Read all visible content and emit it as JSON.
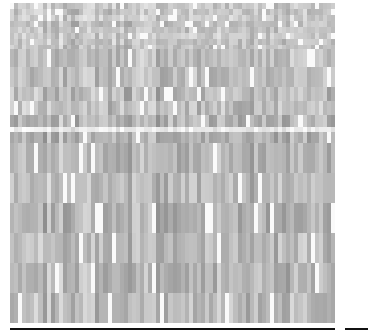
{
  "chart_data": {
    "type": "heatmap",
    "title": "",
    "xlabel": "",
    "ylabel": "",
    "colormap": "grayscale",
    "colors": {
      "low": "#6e6e6e",
      "high": "#ffffff",
      "axis": "#111111"
    },
    "n_columns": 80,
    "row_heights_px": [
      6,
      6,
      6,
      6,
      6,
      6,
      6,
      4,
      18,
      20,
      14,
      14,
      12,
      5,
      11,
      30,
      30,
      30,
      30,
      30,
      30
    ],
    "row_base_gray": [
      200,
      195,
      205,
      190,
      198,
      202,
      196,
      192,
      190,
      188,
      185,
      190,
      180,
      235,
      178,
      182,
      186,
      178,
      184,
      182,
      184
    ],
    "row_variance": [
      40,
      40,
      40,
      40,
      40,
      40,
      40,
      40,
      45,
      50,
      55,
      55,
      50,
      30,
      45,
      45,
      45,
      50,
      45,
      50,
      50
    ],
    "seed": 7
  }
}
